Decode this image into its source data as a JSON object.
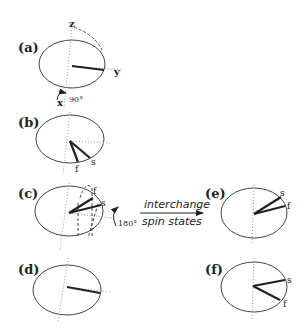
{
  "panels": {
    "a": {
      "label": "(a)",
      "axis_z": "z",
      "axis_y": "y",
      "axis_x": "x",
      "rotation": "90°"
    },
    "b": {
      "label": "(b)",
      "vec_f": "f",
      "vec_s": "s"
    },
    "c": {
      "label": "(c)",
      "vec_f": "f",
      "vec_s": "s",
      "rotation": "180°"
    },
    "d": {
      "label": "(d)"
    },
    "e": {
      "label": "(e)",
      "vec_s": "s",
      "vec_f": "f"
    },
    "f": {
      "label": "(f)",
      "vec_s": "s",
      "vec_f": "f"
    }
  },
  "arrow": {
    "top": "interchange",
    "bottom": "spin states"
  }
}
